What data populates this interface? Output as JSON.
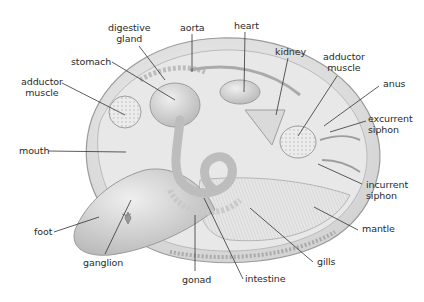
{
  "diagram": {
    "colors": {
      "background": "#ffffff",
      "shell": "#d9d9d9",
      "organ": "#c4c4c4",
      "line": "#333333",
      "text": "#2a2a2a"
    },
    "labels": [
      {
        "id": "digestive-gland",
        "line1": "digestive",
        "line2": "gland"
      },
      {
        "id": "aorta",
        "line1": "aorta"
      },
      {
        "id": "heart",
        "line1": "heart"
      },
      {
        "id": "kidney",
        "line1": "kidney"
      },
      {
        "id": "adductor-muscle-posterior",
        "line1": "adductor",
        "line2": "muscle"
      },
      {
        "id": "stomach",
        "line1": "stomach"
      },
      {
        "id": "adductor-muscle-anterior",
        "line1": "adductor",
        "line2": "muscle"
      },
      {
        "id": "anus",
        "line1": "anus"
      },
      {
        "id": "excurrent-siphon",
        "line1": "excurrent",
        "line2": "siphon"
      },
      {
        "id": "mouth",
        "line1": "mouth"
      },
      {
        "id": "incurrent-siphon",
        "line1": "incurrent",
        "line2": "siphon"
      },
      {
        "id": "foot",
        "line1": "foot"
      },
      {
        "id": "mantle",
        "line1": "mantle"
      },
      {
        "id": "ganglion",
        "line1": "ganglion"
      },
      {
        "id": "gills",
        "line1": "gills"
      },
      {
        "id": "gonad",
        "line1": "gonad"
      },
      {
        "id": "intestine",
        "line1": "intestine"
      }
    ]
  }
}
